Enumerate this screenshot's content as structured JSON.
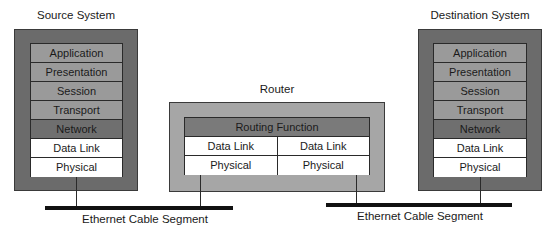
{
  "source_system": {
    "title": "Source System",
    "layers": [
      "Application",
      "Presentation",
      "Session",
      "Transport",
      "Network",
      "Data Link",
      "Physical"
    ]
  },
  "router": {
    "title": "Router",
    "routing_function": "Routing Function",
    "left_layers": [
      "Data Link",
      "Physical"
    ],
    "right_layers": [
      "Data Link",
      "Physical"
    ]
  },
  "destination_system": {
    "title": "Destination System",
    "layers": [
      "Application",
      "Presentation",
      "Session",
      "Transport",
      "Network",
      "Data Link",
      "Physical"
    ]
  },
  "cables": [
    {
      "label": "Ethernet Cable Segment"
    },
    {
      "label": "Ethernet Cable Segment"
    }
  ],
  "colors": {
    "system_box": "#6b6b6b",
    "router_box": "#a6a6a6",
    "upper_layers": "#9a9a9a",
    "network_layer": "#6f6f6f",
    "lower_layers": "#ffffff",
    "cable": "#111111"
  }
}
